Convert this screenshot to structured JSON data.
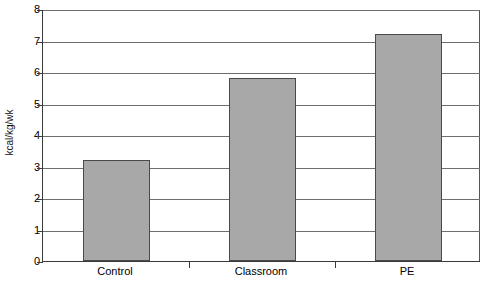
{
  "chart_data": {
    "type": "bar",
    "title": "",
    "xlabel": "",
    "ylabel": "kcal/kg/wk",
    "categories": [
      "Control",
      "Classroom",
      "PE"
    ],
    "values": [
      3.2,
      5.8,
      7.2
    ],
    "ylim": [
      0,
      8
    ],
    "yticks": [
      0,
      1,
      2,
      3,
      4,
      5,
      6,
      7,
      8
    ],
    "ytick_labels": [
      "0",
      "1",
      "2",
      "3",
      "4",
      "5",
      "6",
      "7",
      "8"
    ],
    "grid": true,
    "legend": false,
    "bar_color": "#a8a8a8",
    "bar_edge_color": "#4a4a4a",
    "axis_color": "#3a3a3a",
    "gridline_color": "#6e6e6e",
    "background_color": "#ffffff"
  }
}
